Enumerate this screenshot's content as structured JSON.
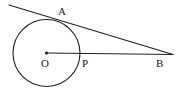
{
  "figure": {
    "type": "geometry-diagram",
    "background_color": "#ffffff",
    "stroke_color": "#231f20",
    "label_color": "#1a1a1a",
    "width": 187,
    "height": 97
  },
  "labels": {
    "a": "A",
    "o": "O",
    "p": "P",
    "b": "B"
  },
  "geometry": {
    "circle": {
      "name": "circle-O",
      "cx": 46.5,
      "cy": 53,
      "r": 33.5,
      "fill": "none"
    },
    "center_dot": {
      "name": "center-point-O",
      "cx": 46.5,
      "cy": 53,
      "r": 1.6
    },
    "tangent_line": {
      "name": "tangent-line-AB",
      "x1": 9,
      "y1": 5,
      "x2": 173,
      "y2": 54.5
    },
    "radius_line": {
      "name": "line-OB",
      "x1": 46.5,
      "y1": 53,
      "x2": 173,
      "y2": 54.5
    },
    "tangent_point_A": {
      "name": "tangent-point-A",
      "x": 53,
      "y": 19.5
    },
    "intersection_point_P": {
      "name": "intersection-point-P",
      "x": 80,
      "y": 53.3
    },
    "vertex_B": {
      "name": "vertex-B",
      "x": 173,
      "y": 54.5
    }
  }
}
